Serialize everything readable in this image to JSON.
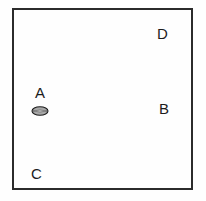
{
  "figure": {
    "background_color": "#fefefe",
    "boundary": {
      "name": "rectangular-boundary",
      "stroke_color": "#2b2b2b",
      "fill_color": "#fefefe",
      "stroke_width_px": 2
    },
    "labels": [
      {
        "id": "a",
        "text": "A",
        "x": 35,
        "y": 85
      },
      {
        "id": "b",
        "text": "B",
        "x": 159,
        "y": 101
      },
      {
        "id": "c",
        "text": "C",
        "x": 31,
        "y": 166
      },
      {
        "id": "d",
        "text": "D",
        "x": 157,
        "y": 26
      }
    ],
    "shapes": [
      {
        "id": "ellipse-marker",
        "icon_name": "shaded-ellipse-icon",
        "type": "ellipse",
        "fill_color": "#a8a8a8",
        "stroke_color": "#1c1c1c",
        "has_center_line": true,
        "center_line_color": "#e8e8e8",
        "x": 31,
        "y": 103,
        "width": 18,
        "height": 12,
        "associated_label": "A"
      }
    ],
    "text_color": "#1c1c1c"
  }
}
